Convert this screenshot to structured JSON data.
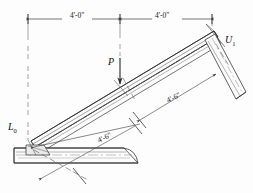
{
  "diagram": {
    "background_color": "#fdfdfd",
    "line_color": "#3a3a3a",
    "text_color": "#1a1a1a",
    "dimensions": {
      "top_left_span": "4'-0\"",
      "top_right_span": "4'-0\"",
      "slope_lower": "4'-6\"",
      "slope_upper": "4'-6\""
    },
    "labels": {
      "load": "P",
      "joint_lower": "L",
      "joint_lower_sub": "0",
      "joint_upper": "U",
      "joint_upper_sub": "1"
    }
  }
}
